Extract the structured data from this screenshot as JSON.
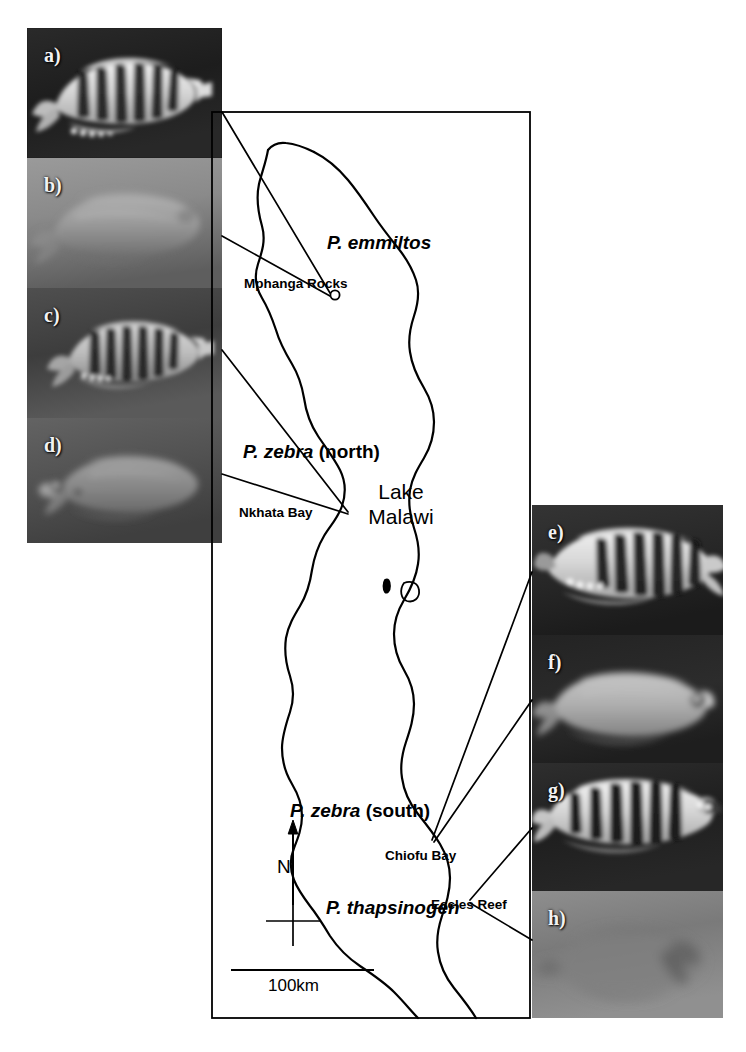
{
  "figure": {
    "lake_name_line1": "Lake",
    "lake_name_line2": "Malawi",
    "scale_bar_label": "100km",
    "compass_label": "N",
    "background_color": "#ffffff",
    "line_color": "#000000"
  },
  "species_labels": [
    {
      "id": "emmiltos",
      "name": "P. emmiltos",
      "qualifier": "",
      "x": 327,
      "y": 232
    },
    {
      "id": "zebra-north",
      "name": "P. zebra",
      "qualifier": " (north)",
      "x": 243,
      "y": 441
    },
    {
      "id": "zebra-south",
      "name": "P. zebra",
      "qualifier": " (south)",
      "x": 290,
      "y": 800
    },
    {
      "id": "thapsinogen",
      "name": "P. thapsinogen",
      "qualifier": "",
      "x": 326,
      "y": 897
    }
  ],
  "site_labels": [
    {
      "id": "mphanga-rocks",
      "name": "Mphanga Rocks",
      "x": 244,
      "y": 276
    },
    {
      "id": "nkhata-bay",
      "name": "Nkhata Bay",
      "x": 239,
      "y": 505
    },
    {
      "id": "chiofu-bay",
      "name": "Chiofu Bay",
      "x": 385,
      "y": 848
    },
    {
      "id": "eccles-reef",
      "name": "Eccles Reef",
      "x": 431,
      "y": 897
    }
  ],
  "left_photos": [
    {
      "letter": "a)",
      "species": "P. emmiltos",
      "site": "Mphanga Rocks",
      "tone": "dark",
      "morph": "barred"
    },
    {
      "letter": "b)",
      "species": "P. emmiltos",
      "site": "Mphanga Rocks",
      "tone": "light",
      "morph": "plain"
    },
    {
      "letter": "c)",
      "species": "P. zebra north",
      "site": "Nkhata Bay",
      "tone": "mid",
      "morph": "barred"
    },
    {
      "letter": "d)",
      "species": "P. zebra north",
      "site": "Nkhata Bay",
      "tone": "mid",
      "morph": "plain"
    }
  ],
  "right_photos": [
    {
      "letter": "e)",
      "species": "P. zebra south",
      "site": "Chiofu Bay",
      "tone": "dark",
      "morph": "barred"
    },
    {
      "letter": "f)",
      "species": "P. zebra south",
      "site": "Chiofu Bay",
      "tone": "dark",
      "morph": "plain"
    },
    {
      "letter": "g)",
      "species": "P. thapsinogen",
      "site": "Eccles Reef",
      "tone": "dark",
      "morph": "barred"
    },
    {
      "letter": "h)",
      "species": "P. thapsinogen",
      "site": "Eccles Reef",
      "tone": "light",
      "morph": "plain"
    }
  ],
  "map_frame": {
    "x": 212,
    "y": 112,
    "width": 318,
    "height": 906
  },
  "left_panel_frame": {
    "x": 27,
    "y": 28,
    "width": 195,
    "height": 515
  },
  "right_panel_frame": {
    "x": 532,
    "y": 505,
    "width": 191,
    "height": 513
  }
}
